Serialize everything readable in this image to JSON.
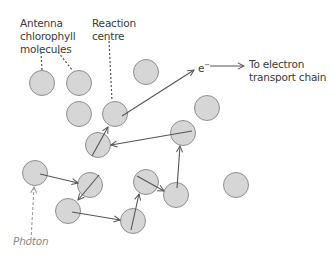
{
  "labels": {
    "antenna": "Antenna\nchlorophyll\nmolecules",
    "reaction_centre": "Reaction\ncentre",
    "electron": "e",
    "electron_superscript": "−",
    "destination": "To electron\ntransport chain",
    "photon": "Photon"
  },
  "colors": {
    "molecule_fill": "#d6d6d6",
    "molecule_stroke": "#8e8e8e",
    "arrow": "#555555",
    "photon": "#9a9a9a",
    "text": "#3a3a3a"
  },
  "molecules": [
    {
      "id": "antenna-1",
      "cx": 42,
      "cy": 83
    },
    {
      "id": "antenna-2",
      "cx": 79,
      "cy": 83
    },
    {
      "id": "m3",
      "cx": 79,
      "cy": 114
    },
    {
      "id": "reaction-centre",
      "cx": 115,
      "cy": 114
    },
    {
      "id": "m5",
      "cx": 146,
      "cy": 72
    },
    {
      "id": "m6",
      "cx": 207,
      "cy": 108
    },
    {
      "id": "m7",
      "cx": 183,
      "cy": 133
    },
    {
      "id": "m8",
      "cx": 98,
      "cy": 145
    },
    {
      "id": "photon-target",
      "cx": 35,
      "cy": 173
    },
    {
      "id": "m10",
      "cx": 90,
      "cy": 185
    },
    {
      "id": "m11",
      "cx": 68,
      "cy": 211
    },
    {
      "id": "m12",
      "cx": 133,
      "cy": 221
    },
    {
      "id": "m13",
      "cx": 146,
      "cy": 182
    },
    {
      "id": "m14",
      "cx": 176,
      "cy": 195
    },
    {
      "id": "m15",
      "cx": 236,
      "cy": 185
    }
  ],
  "energy_transfer_path": [
    "photon-target",
    "m10",
    "m11",
    "m12",
    "m13",
    "m14",
    "m7",
    "m8",
    "reaction-centre",
    "electron"
  ]
}
